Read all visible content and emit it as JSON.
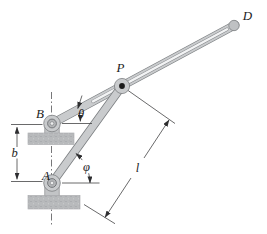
{
  "figure": {
    "labels": {
      "point_d": "D",
      "point_p": "P",
      "point_b": "B",
      "point_a": "A",
      "dim_b": "b",
      "dim_l": "l",
      "angle_theta": "θ",
      "angle_phi": "φ"
    },
    "colors": {
      "background": "#ffffff",
      "metal_fill": "#c9cbcd",
      "metal_stroke": "#7d8083",
      "slot_fill": "#f2f3f4",
      "ground_fill": "#b8babc",
      "annotation_line": "#38383a",
      "pin_dark": "#1b1b1b"
    }
  }
}
